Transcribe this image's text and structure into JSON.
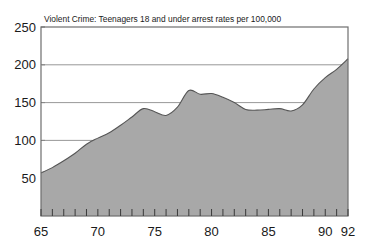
{
  "chart_data": {
    "type": "area",
    "title": "Violent Crime: Teenagers 18 and under arrest rates per 100,000",
    "xlabel": "",
    "ylabel": "",
    "xlim": [
      65,
      92
    ],
    "ylim": [
      0,
      250
    ],
    "grid": true,
    "gridlines_y": [
      100,
      150,
      200
    ],
    "legend": "none",
    "y_ticks": [
      50,
      100,
      150,
      200,
      250
    ],
    "y_tick_labels": [
      "50",
      "100",
      "150",
      "200",
      "250"
    ],
    "x_ticks": [
      65,
      66,
      67,
      68,
      69,
      70,
      71,
      72,
      73,
      74,
      75,
      76,
      77,
      78,
      79,
      80,
      81,
      82,
      83,
      84,
      85,
      86,
      87,
      88,
      89,
      90,
      91,
      92
    ],
    "x_tick_labels": [
      "65",
      "70",
      "75",
      "80",
      "85",
      "90",
      "92"
    ],
    "x_labeled_ticks": [
      65,
      70,
      75,
      80,
      85,
      90,
      92
    ],
    "x": [
      65,
      66,
      67,
      68,
      69,
      70,
      71,
      72,
      73,
      74,
      75,
      76,
      77,
      78,
      79,
      80,
      81,
      82,
      83,
      84,
      85,
      86,
      87,
      88,
      89,
      90,
      91,
      92
    ],
    "values": [
      57,
      64,
      73,
      83,
      95,
      103,
      110,
      120,
      131,
      142,
      138,
      133,
      144,
      166,
      161,
      162,
      157,
      150,
      141,
      140,
      141,
      142,
      139,
      147,
      168,
      183,
      194,
      208
    ],
    "series": [
      {
        "name": "Teenagers 18 and under arrest rate per 100,000",
        "values": [
          57,
          64,
          73,
          83,
          95,
          103,
          110,
          120,
          131,
          142,
          138,
          133,
          144,
          166,
          161,
          162,
          157,
          150,
          141,
          140,
          141,
          142,
          139,
          147,
          168,
          183,
          194,
          208
        ]
      }
    ],
    "colors": {
      "area_fill": "#a8a8a8",
      "area_line": "#555555",
      "frame": "#6e6e6e",
      "gridline": "#8c8c8c",
      "text": "#1a1a1a"
    }
  }
}
